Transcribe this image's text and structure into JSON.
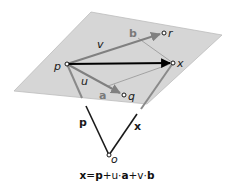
{
  "diagram": {
    "colors": {
      "plane": "#d6d6d6",
      "plane_edge": "#bdbdbd",
      "in_plane_vector": "#808080",
      "main_vector": "#000000",
      "position_vector": "#1a1a1a",
      "guide_line": "#8c8c8c"
    },
    "plane": {
      "corners": [
        [
          91,
          12
        ],
        [
          222,
          35
        ],
        [
          147,
          104
        ],
        [
          14,
          91
        ]
      ]
    },
    "points": [
      {
        "id": "p",
        "label": "p",
        "x": 67,
        "y": 64,
        "label_x": 54,
        "label_y": 70
      },
      {
        "id": "r",
        "label": "r",
        "x": 164,
        "y": 33,
        "label_x": 168,
        "label_y": 37
      },
      {
        "id": "x",
        "label": "x",
        "x": 173,
        "y": 63,
        "label_x": 177,
        "label_y": 67
      },
      {
        "id": "q",
        "label": "q",
        "x": 124,
        "y": 95,
        "label_x": 128,
        "label_y": 100
      },
      {
        "id": "o",
        "label": "o",
        "x": 109,
        "y": 155,
        "label_x": 111,
        "label_y": 163
      }
    ],
    "vector_labels": {
      "v": "v",
      "b": "b",
      "u": "u",
      "a": "a",
      "p": "p",
      "x": "x"
    },
    "formula": {
      "x": "x",
      "eq": "=",
      "p": "p",
      "plus1": "+u·",
      "a": "a",
      "plus2": "+v·",
      "b": "b"
    }
  }
}
